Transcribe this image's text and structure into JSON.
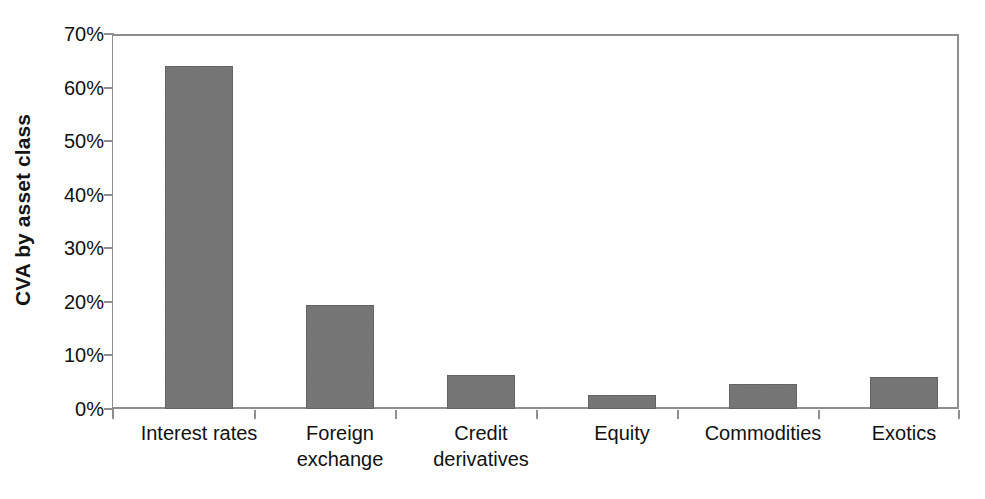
{
  "chart_data": {
    "type": "bar",
    "title": "",
    "xlabel": "",
    "ylabel": "CVA by asset class",
    "categories": [
      "Interest rates",
      "Foreign\nexchange",
      "Credit\nderivatives",
      "Equity",
      "Commodities",
      "Exotics"
    ],
    "values": [
      64,
      19.4,
      6.3,
      2.6,
      4.7,
      6.0
    ],
    "value_labels": [
      "64%",
      "19%",
      "6%",
      "3%",
      "5%",
      "6%"
    ],
    "ylim": [
      0,
      70
    ],
    "ytick_values": [
      0,
      10,
      20,
      30,
      40,
      50,
      60,
      70
    ],
    "ytick_labels": [
      "0%",
      "10%",
      "20%",
      "30%",
      "40%",
      "50%",
      "60%",
      "70%"
    ],
    "grid": false,
    "legend": false,
    "legend_position": "none",
    "bar_color": "#6f6f6f",
    "axis_color": "#8e8e8e",
    "text_color": "#111111",
    "background_color": "#ffffff"
  },
  "axis": {
    "y_title": "CVA by asset class"
  },
  "ytick": {
    "t0": "0%",
    "t1": "10%",
    "t2": "20%",
    "t3": "30%",
    "t4": "40%",
    "t5": "50%",
    "t6": "60%",
    "t7": "70%"
  },
  "xtick": {
    "c0_line1": "Interest rates",
    "c0_line2": "",
    "c1_line1": "Foreign",
    "c1_line2": "exchange",
    "c2_line1": "Credit",
    "c2_line2": "derivatives",
    "c3_line1": "Equity",
    "c3_line2": "",
    "c4_line1": "Commodities",
    "c4_line2": "",
    "c5_line1": "Exotics",
    "c5_line2": ""
  }
}
